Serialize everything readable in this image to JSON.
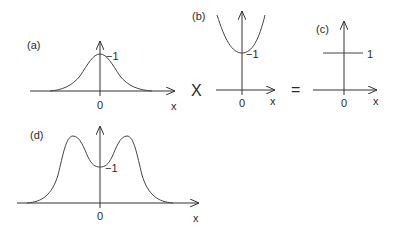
{
  "figure": {
    "panels": [
      {
        "id": "a",
        "label": "(a)",
        "value_label": "−1",
        "origin_label": "0",
        "axis_label": "x",
        "shape": "single bell-shaped peak centered at 0"
      },
      {
        "id": "b",
        "label": "(b)",
        "value_label": "−1",
        "origin_label": "0",
        "axis_label": "x",
        "shape": "upward parabola with minimum at 0"
      },
      {
        "id": "c",
        "label": "(c)",
        "value_label": "1",
        "origin_label": "0",
        "axis_label": "x",
        "shape": "constant horizontal line"
      },
      {
        "id": "d",
        "label": "(d)",
        "value_label": "−1",
        "origin_label": "0",
        "axis_label": "x",
        "shape": "double-humped curve with central dip at 0"
      }
    ],
    "operators": {
      "times": "X",
      "equals": "="
    }
  }
}
